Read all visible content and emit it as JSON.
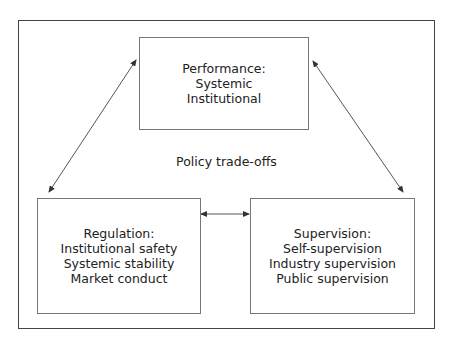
{
  "diagram": {
    "center_label": "Policy trade-offs",
    "boxes": {
      "performance": {
        "title": "Performance:",
        "items": [
          "Systemic",
          "Institutional"
        ]
      },
      "regulation": {
        "title": "Regulation:",
        "items": [
          "Institutional safety",
          "Systemic stability",
          "Market conduct"
        ]
      },
      "supervision": {
        "title": "Supervision:",
        "items": [
          "Self-supervision",
          "Industry supervision",
          "Public supervision"
        ]
      }
    },
    "connections": [
      {
        "from": "performance",
        "to": "regulation",
        "type": "bidirectional"
      },
      {
        "from": "performance",
        "to": "supervision",
        "type": "bidirectional"
      },
      {
        "from": "regulation",
        "to": "supervision",
        "type": "bidirectional"
      }
    ],
    "colors": {
      "line": "#444444",
      "box_border": "#777777",
      "text": "#222222"
    }
  }
}
